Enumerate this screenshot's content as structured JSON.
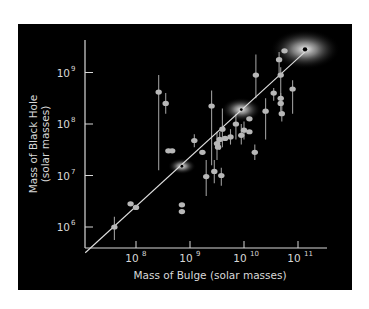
{
  "chart_data": {
    "type": "scatter",
    "title": "",
    "xlabel": "Mass of Bulge (solar masses)",
    "ylabel_line1": "Mass of Black Hole",
    "ylabel_line2": "(solar masses)",
    "xscale": "log",
    "yscale": "log",
    "xlim_log10": [
      7.06,
      11.55
    ],
    "ylim_log10": [
      5.5,
      9.6
    ],
    "x_ticks": [
      {
        "base": "10",
        "exp": "8",
        "v": 8
      },
      {
        "base": "10",
        "exp": "9",
        "v": 9
      },
      {
        "base": "10",
        "exp": "10",
        "v": 10
      },
      {
        "base": "10",
        "exp": "11",
        "v": 11
      }
    ],
    "y_ticks": [
      {
        "base": "10",
        "exp": "6",
        "v": 6
      },
      {
        "base": "10",
        "exp": "7",
        "v": 7
      },
      {
        "base": "10",
        "exp": "8",
        "v": 8
      },
      {
        "base": "10",
        "exp": "9",
        "v": 9
      }
    ],
    "grid": false,
    "legend": null,
    "colors": {
      "background": "#000000",
      "points": "#b8b8b8",
      "axes": "#d8d8d8",
      "fit_line": "#e0e0e0",
      "glow": "#ffffff"
    },
    "fit_line": {
      "from_log10": [
        7.06,
        5.5
      ],
      "to_log10": [
        11.15,
        9.42
      ]
    },
    "highlighted_galaxies": [
      {
        "x_log10": 8.85,
        "y_log10": 7.18,
        "glow_rx": 14,
        "glow_ry": 8
      },
      {
        "x_log10": 9.95,
        "y_log10": 8.28,
        "glow_rx": 20,
        "glow_ry": 12
      },
      {
        "x_log10": 11.13,
        "y_log10": 9.45,
        "glow_rx": 35,
        "glow_ry": 20
      }
    ],
    "points": [
      {
        "x": 7.6,
        "y": 6.0,
        "lo": 5.75,
        "hi": 6.2
      },
      {
        "x": 7.9,
        "y": 6.45,
        "lo": 6.45,
        "hi": 6.45
      },
      {
        "x": 8.0,
        "y": 6.38,
        "lo": 6.38,
        "hi": 6.38
      },
      {
        "x": 8.42,
        "y": 8.62,
        "lo": 7.1,
        "hi": 8.95
      },
      {
        "x": 8.55,
        "y": 8.4,
        "lo": 8.2,
        "hi": 8.6
      },
      {
        "x": 8.6,
        "y": 7.48,
        "lo": 7.48,
        "hi": 7.48
      },
      {
        "x": 8.67,
        "y": 7.48,
        "lo": 7.48,
        "hi": 7.48
      },
      {
        "x": 8.85,
        "y": 6.3,
        "lo": 6.3,
        "hi": 6.3
      },
      {
        "x": 8.85,
        "y": 6.43,
        "lo": 6.43,
        "hi": 6.43
      },
      {
        "x": 9.08,
        "y": 7.68,
        "lo": 7.55,
        "hi": 7.8
      },
      {
        "x": 9.23,
        "y": 7.45,
        "lo": 7.45,
        "hi": 7.45
      },
      {
        "x": 9.3,
        "y": 6.98,
        "lo": 6.6,
        "hi": 7.3
      },
      {
        "x": 9.4,
        "y": 8.35,
        "lo": 7.2,
        "hi": 8.65
      },
      {
        "x": 9.45,
        "y": 7.08,
        "lo": 6.85,
        "hi": 7.3
      },
      {
        "x": 9.5,
        "y": 7.62,
        "lo": 7.3,
        "hi": 7.85
      },
      {
        "x": 9.55,
        "y": 7.7,
        "lo": 7.5,
        "hi": 7.85
      },
      {
        "x": 9.52,
        "y": 7.55,
        "lo": 7.55,
        "hi": 7.55
      },
      {
        "x": 9.58,
        "y": 7.0,
        "lo": 6.8,
        "hi": 7.15
      },
      {
        "x": 9.6,
        "y": 7.9,
        "lo": 7.55,
        "hi": 8.3
      },
      {
        "x": 9.65,
        "y": 7.72,
        "lo": 7.72,
        "hi": 7.72
      },
      {
        "x": 9.75,
        "y": 7.75,
        "lo": 7.6,
        "hi": 7.9
      },
      {
        "x": 9.85,
        "y": 8.0,
        "lo": 7.7,
        "hi": 8.2
      },
      {
        "x": 9.95,
        "y": 7.78,
        "lo": 7.6,
        "hi": 8.0
      },
      {
        "x": 10.0,
        "y": 7.88,
        "lo": 7.7,
        "hi": 8.05
      },
      {
        "x": 10.1,
        "y": 7.85,
        "lo": 7.85,
        "hi": 7.85
      },
      {
        "x": 10.1,
        "y": 8.1,
        "lo": 8.1,
        "hi": 8.1
      },
      {
        "x": 10.22,
        "y": 8.95,
        "lo": 8.5,
        "hi": 9.35
      },
      {
        "x": 10.2,
        "y": 7.45,
        "lo": 7.3,
        "hi": 7.6
      },
      {
        "x": 10.4,
        "y": 8.25,
        "lo": 7.7,
        "hi": 8.5
      },
      {
        "x": 10.55,
        "y": 8.6,
        "lo": 8.45,
        "hi": 8.7
      },
      {
        "x": 10.65,
        "y": 9.25,
        "lo": 8.9,
        "hi": 9.4
      },
      {
        "x": 10.68,
        "y": 8.95,
        "lo": 8.4,
        "hi": 9.1
      },
      {
        "x": 10.68,
        "y": 8.5,
        "lo": 8.35,
        "hi": 8.6
      },
      {
        "x": 10.68,
        "y": 8.4,
        "lo": 8.25,
        "hi": 8.55
      },
      {
        "x": 10.7,
        "y": 8.2,
        "lo": 8.05,
        "hi": 8.35
      },
      {
        "x": 10.75,
        "y": 9.42,
        "lo": 9.42,
        "hi": 9.42
      },
      {
        "x": 10.9,
        "y": 8.68,
        "lo": 8.2,
        "hi": 8.85
      }
    ]
  }
}
